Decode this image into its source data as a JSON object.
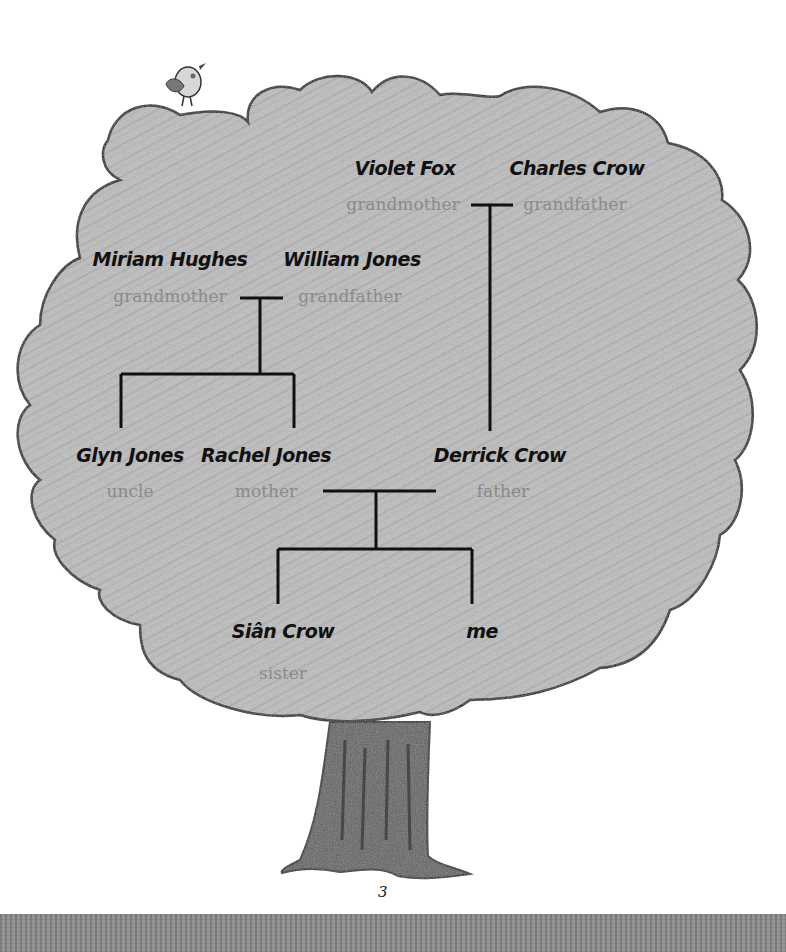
{
  "page": {
    "number": "3"
  },
  "family_tree": {
    "members": [
      {
        "id": "violet",
        "name": "Violet Fox",
        "role": "grandmother",
        "x": 405,
        "name_y": 157,
        "role_y": 194,
        "role_x": 403
      },
      {
        "id": "charles",
        "name": "Charles Crow",
        "role": "grandfather",
        "x": 577,
        "name_y": 157,
        "role_y": 194,
        "role_x": 575
      },
      {
        "id": "miriam",
        "name": "Miriam Hughes",
        "role": "grandmother",
        "x": 170,
        "name_y": 248,
        "role_y": 286,
        "role_x": 170
      },
      {
        "id": "william",
        "name": "William Jones",
        "role": "grandfather",
        "x": 352,
        "name_y": 248,
        "role_y": 286,
        "role_x": 350
      },
      {
        "id": "glyn",
        "name": "Glyn Jones",
        "role": "uncle",
        "x": 130,
        "name_y": 444,
        "role_y": 481,
        "role_x": 130
      },
      {
        "id": "rachel",
        "name": "Rachel Jones",
        "role": "mother",
        "x": 266,
        "name_y": 444,
        "role_y": 481,
        "role_x": 266
      },
      {
        "id": "derrick",
        "name": "Derrick Crow",
        "role": "father",
        "x": 500,
        "name_y": 444,
        "role_y": 481,
        "role_x": 503
      },
      {
        "id": "sian",
        "name": "Siân Crow",
        "role": "sister",
        "x": 283,
        "name_y": 620,
        "role_y": 663,
        "role_x": 283
      },
      {
        "id": "me",
        "name": "me",
        "role": "",
        "x": 482,
        "name_y": 620,
        "role_y": 663,
        "role_x": 482
      }
    ]
  },
  "colors": {
    "canopy": "#b9b9b9",
    "trunk": "#5e5e5e",
    "outline": "#111111",
    "name_text": "#111111",
    "role_text": "#8a8a8a",
    "ground": "#8c8c8c"
  }
}
